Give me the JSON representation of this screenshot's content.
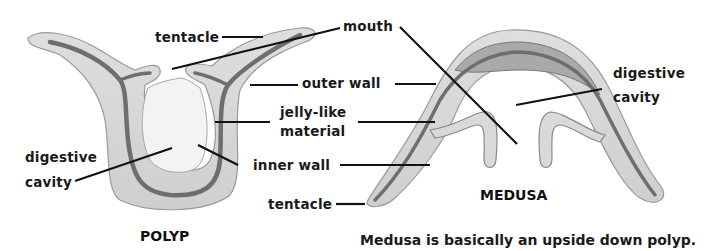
{
  "diagram": {
    "polyp": {
      "title": "POLYP",
      "labels": {
        "tentacle": "tentacle",
        "digestive_cavity_line1": "digestive",
        "digestive_cavity_line2": "cavity"
      }
    },
    "medusa": {
      "title": "MEDUSA",
      "labels": {
        "digestive_cavity_line1": "digestive",
        "digestive_cavity_line2": "cavity"
      }
    },
    "shared_labels": {
      "mouth": "mouth",
      "outer_wall": "outer wall",
      "jelly_like_line1": "jelly-like",
      "jelly_like_line2": "material",
      "inner_wall": "inner wall",
      "tentacle": "tentacle"
    },
    "caption": "Medusa is basically an upside down polyp.",
    "colors": {
      "background": "#ffffff",
      "outer_layer": "#d9d9d9",
      "outer_edge": "#9a9a9a",
      "jelly_layer": "#bdbdbd",
      "inner_layer": "#6e6e6e",
      "cavity": "#ffffff",
      "leader_lines": "#111111",
      "text": "#1a1a1a"
    }
  }
}
